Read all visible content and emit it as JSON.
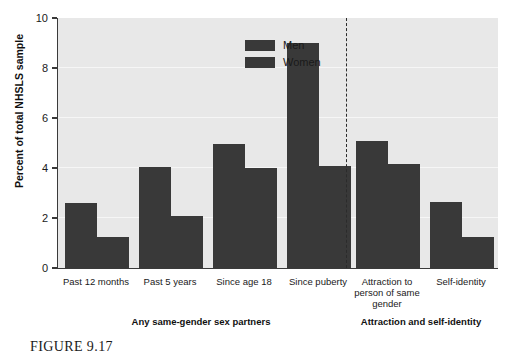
{
  "caption": "FIGURE 9.17",
  "legend": {
    "items": [
      {
        "label": "Men",
        "color": "#393939"
      },
      {
        "label": "Women",
        "color": "#393939"
      }
    ]
  },
  "axis": {
    "y_title": "Percent of total NHSLS sample",
    "y_ticks": [
      "0",
      "2",
      "4",
      "6",
      "8",
      "10"
    ]
  },
  "groups": [
    {
      "label": "Any same-gender sex partners"
    },
    {
      "label": "Attraction and self-identity"
    }
  ],
  "chart_data": {
    "type": "bar",
    "title": "",
    "xlabel": "",
    "ylabel": "Percent of total NHSLS sample",
    "ylim": [
      0,
      10
    ],
    "yticks": [
      0,
      2,
      4,
      6,
      8,
      10
    ],
    "grid": true,
    "legend_position": "top-center",
    "categories": [
      "Past 12 months",
      "Past 5 years",
      "Since age 18",
      "Since puberty",
      "Attraction to person of same gender",
      "Self-identity"
    ],
    "category_display": [
      "Past 12 months",
      "Past 5 years",
      "Since age 18",
      "Since puberty",
      "Attraction to\nperson of same\ngender",
      "Self-identity"
    ],
    "series": [
      {
        "name": "Men",
        "values": [
          2.6,
          4.05,
          4.95,
          9.0,
          5.1,
          2.65
        ]
      },
      {
        "name": "Women",
        "values": [
          1.25,
          2.1,
          4.0,
          4.1,
          4.15,
          1.25
        ]
      }
    ],
    "group_separator": {
      "style": "dashed",
      "after_category": "Since puberty"
    },
    "supergroups": [
      {
        "label": "Any same-gender sex partners",
        "categories": [
          "Past 12 months",
          "Past 5 years",
          "Since age 18",
          "Since puberty"
        ]
      },
      {
        "label": "Attraction and self-identity",
        "categories": [
          "Attraction to person of same gender",
          "Self-identity"
        ]
      }
    ]
  }
}
